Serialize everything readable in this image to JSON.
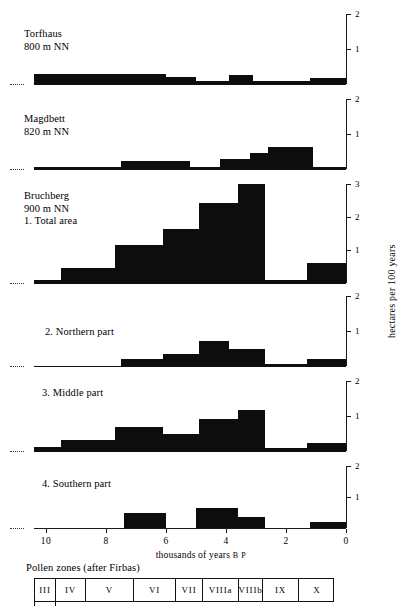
{
  "figure": {
    "yaxis_title": "hectares per 100 years",
    "xaxis_title_main": "thousands of years ",
    "xaxis_title_suffix": "B P",
    "x_ticks": [
      "10",
      "8",
      "6",
      "4",
      "2",
      "0"
    ],
    "x_tick_values": [
      10,
      8,
      6,
      4,
      2,
      0
    ],
    "zero_label": "0"
  },
  "pollen_zones": {
    "caption": "Pollen zones (after Firbas)",
    "cells": [
      {
        "label": "III",
        "start": 10.4,
        "end": 9.7
      },
      {
        "label": "IV",
        "start": 9.7,
        "end": 8.7
      },
      {
        "label": "V",
        "start": 8.7,
        "end": 7.1
      },
      {
        "label": "VI",
        "start": 7.1,
        "end": 5.7
      },
      {
        "label": "VII",
        "start": 5.7,
        "end": 4.8
      },
      {
        "label": "VIIIa",
        "start": 4.8,
        "end": 3.6
      },
      {
        "label": "VIIIb",
        "start": 3.6,
        "end": 2.8
      },
      {
        "label": "IX",
        "start": 2.8,
        "end": 1.6
      },
      {
        "label": "X",
        "start": 1.6,
        "end": 0.4
      }
    ]
  },
  "chart_data": {
    "type": "bar",
    "title": "",
    "xlabel": "thousands of years B P",
    "ylabel": "hectares per 100 years",
    "xlim": [
      10.5,
      0
    ],
    "grid": false,
    "legend": "none",
    "panels": [
      {
        "name": "torfhaus",
        "label_lines": [
          "Torfhaus",
          "800 m NN"
        ],
        "ylim": [
          0,
          2
        ],
        "yticks": [
          1,
          2
        ],
        "ytick_labels": [
          "1",
          "2"
        ],
        "bars": [
          {
            "x_start": 10.4,
            "x_end": 6.0,
            "value": 0.28
          },
          {
            "x_start": 6.0,
            "x_end": 5.0,
            "value": 0.2
          },
          {
            "x_start": 5.0,
            "x_end": 3.9,
            "value": 0.1
          },
          {
            "x_start": 3.9,
            "x_end": 3.1,
            "value": 0.25
          },
          {
            "x_start": 3.1,
            "x_end": 1.2,
            "value": 0.08
          },
          {
            "x_start": 1.2,
            "x_end": 0.0,
            "value": 0.18
          }
        ]
      },
      {
        "name": "magdbett",
        "label_lines": [
          "Magdbett",
          "820 m NN"
        ],
        "ylim": [
          0,
          2
        ],
        "yticks": [
          1,
          2
        ],
        "ytick_labels": [
          "1",
          "2"
        ],
        "bars": [
          {
            "x_start": 10.4,
            "x_end": 7.5,
            "value": 0.05
          },
          {
            "x_start": 7.5,
            "x_end": 5.2,
            "value": 0.22
          },
          {
            "x_start": 5.2,
            "x_end": 4.2,
            "value": 0.05
          },
          {
            "x_start": 4.2,
            "x_end": 3.2,
            "value": 0.3
          },
          {
            "x_start": 3.2,
            "x_end": 2.6,
            "value": 0.45
          },
          {
            "x_start": 2.6,
            "x_end": 1.1,
            "value": 0.62
          },
          {
            "x_start": 1.1,
            "x_end": 0.0,
            "value": 0.07
          }
        ]
      },
      {
        "name": "bruchberg-total",
        "label_lines": [
          "Bruchberg",
          "900 m NN",
          "1. Total area"
        ],
        "ylim": [
          0,
          3
        ],
        "yticks": [
          1,
          2,
          3
        ],
        "ytick_labels": [
          "1",
          "2",
          "3"
        ],
        "bars": [
          {
            "x_start": 10.4,
            "x_end": 9.5,
            "value": 0.1
          },
          {
            "x_start": 9.5,
            "x_end": 7.7,
            "value": 0.45
          },
          {
            "x_start": 7.7,
            "x_end": 6.1,
            "value": 1.15
          },
          {
            "x_start": 6.1,
            "x_end": 4.9,
            "value": 1.65
          },
          {
            "x_start": 4.9,
            "x_end": 3.6,
            "value": 2.42
          },
          {
            "x_start": 3.6,
            "x_end": 2.7,
            "value": 3.0
          },
          {
            "x_start": 2.7,
            "x_end": 1.3,
            "value": 0.1
          },
          {
            "x_start": 1.3,
            "x_end": 0.0,
            "value": 0.62
          }
        ]
      },
      {
        "name": "northern-part",
        "label_lines": [
          "2. Northern part"
        ],
        "ylim": [
          0,
          2
        ],
        "yticks": [
          1,
          2
        ],
        "ytick_labels": [
          "1",
          "2"
        ],
        "bars": [
          {
            "x_start": 10.4,
            "x_end": 7.5,
            "value": 0.0
          },
          {
            "x_start": 7.5,
            "x_end": 6.1,
            "value": 0.2
          },
          {
            "x_start": 6.1,
            "x_end": 4.9,
            "value": 0.35
          },
          {
            "x_start": 4.9,
            "x_end": 3.9,
            "value": 0.72
          },
          {
            "x_start": 3.9,
            "x_end": 2.7,
            "value": 0.5
          },
          {
            "x_start": 2.7,
            "x_end": 1.3,
            "value": 0.05
          },
          {
            "x_start": 1.3,
            "x_end": 0.0,
            "value": 0.2
          }
        ]
      },
      {
        "name": "middle-part",
        "label_lines": [
          "3. Middle part"
        ],
        "ylim": [
          0,
          2
        ],
        "yticks": [
          1,
          2
        ],
        "ytick_labels": [
          "1",
          "2"
        ],
        "bars": [
          {
            "x_start": 10.4,
            "x_end": 9.5,
            "value": 0.12
          },
          {
            "x_start": 9.5,
            "x_end": 7.7,
            "value": 0.32
          },
          {
            "x_start": 7.7,
            "x_end": 6.1,
            "value": 0.68
          },
          {
            "x_start": 6.1,
            "x_end": 4.9,
            "value": 0.5
          },
          {
            "x_start": 4.9,
            "x_end": 3.6,
            "value": 0.92
          },
          {
            "x_start": 3.6,
            "x_end": 2.7,
            "value": 1.18
          },
          {
            "x_start": 2.7,
            "x_end": 1.3,
            "value": 0.1
          },
          {
            "x_start": 1.3,
            "x_end": 0.0,
            "value": 0.22
          }
        ]
      },
      {
        "name": "southern-part",
        "label_lines": [
          "4. Southern part"
        ],
        "ylim": [
          0,
          2
        ],
        "yticks": [
          1,
          2
        ],
        "ytick_labels": [
          "1",
          "2"
        ],
        "bars": [
          {
            "x_start": 10.4,
            "x_end": 7.4,
            "value": 0.0
          },
          {
            "x_start": 7.4,
            "x_end": 6.0,
            "value": 0.5
          },
          {
            "x_start": 6.0,
            "x_end": 5.0,
            "value": 0.0
          },
          {
            "x_start": 5.0,
            "x_end": 3.6,
            "value": 0.66
          },
          {
            "x_start": 3.6,
            "x_end": 2.7,
            "value": 0.35
          },
          {
            "x_start": 2.7,
            "x_end": 1.2,
            "value": 0.0
          },
          {
            "x_start": 1.2,
            "x_end": 0.0,
            "value": 0.18
          }
        ]
      }
    ]
  }
}
